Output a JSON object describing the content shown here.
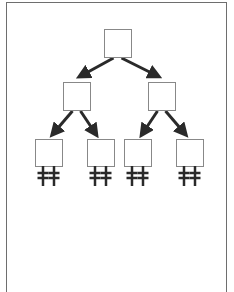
{
  "diagram": {
    "type": "binary-tree",
    "stroke_color": "#888888",
    "arrow_color": "#2a2a2a",
    "nodes": [
      {
        "id": "root",
        "level": 0,
        "x": 104,
        "y": 29,
        "w": 27,
        "h": 28
      },
      {
        "id": "left",
        "level": 1,
        "x": 63,
        "y": 82,
        "w": 27,
        "h": 28
      },
      {
        "id": "right",
        "level": 1,
        "x": 148,
        "y": 82,
        "w": 27,
        "h": 28
      },
      {
        "id": "leaf-1",
        "level": 2,
        "x": 35,
        "y": 139,
        "w": 27,
        "h": 27
      },
      {
        "id": "leaf-2",
        "level": 2,
        "x": 87,
        "y": 139,
        "w": 27,
        "h": 27
      },
      {
        "id": "leaf-3",
        "level": 2,
        "x": 124,
        "y": 139,
        "w": 27,
        "h": 27
      },
      {
        "id": "leaf-4",
        "level": 2,
        "x": 176,
        "y": 139,
        "w": 27,
        "h": 27
      }
    ],
    "edges": [
      {
        "from": "root",
        "to": "left"
      },
      {
        "from": "root",
        "to": "right"
      },
      {
        "from": "left",
        "to": "leaf-1"
      },
      {
        "from": "left",
        "to": "leaf-2"
      },
      {
        "from": "right",
        "to": "leaf-3"
      },
      {
        "from": "right",
        "to": "leaf-4"
      }
    ],
    "leaf_terminals": "double-cross-icon"
  }
}
